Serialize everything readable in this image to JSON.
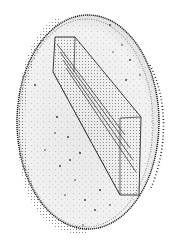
{
  "image": {
    "description": "Stippled pen illustration of an oval disc with a transparent rectangular slab passing diagonally through it",
    "style": "stipple / dot-shading, black ink on white",
    "colors": {
      "background": "#ffffff",
      "disc_fill": "#ececec",
      "ink": "#1a1a1a",
      "slab_lines": "#2a2a2a"
    }
  },
  "disc": {
    "center_x": 88,
    "center_y": 122,
    "radius_x": 71,
    "radius_y": 107,
    "rim_thickness": 3
  },
  "slab": {
    "outer_polygon": [
      [
        55,
        37
      ],
      [
        75,
        37
      ],
      [
        141,
        117
      ],
      [
        139,
        195
      ],
      [
        120,
        195
      ],
      [
        53,
        72
      ]
    ],
    "inner_lines": [
      [
        [
          57,
          44
        ],
        [
          125,
          135
        ]
      ],
      [
        [
          60,
          52
        ],
        [
          130,
          148
        ]
      ],
      [
        [
          63,
          60
        ],
        [
          133,
          160
        ]
      ],
      [
        [
          66,
          68
        ],
        [
          136,
          172
        ]
      ],
      [
        [
          75,
          37
        ],
        [
          74,
          72
        ]
      ],
      [
        [
          120,
          118
        ],
        [
          120,
          195
        ]
      ],
      [
        [
          141,
          117
        ],
        [
          120,
          118
        ]
      ]
    ]
  }
}
